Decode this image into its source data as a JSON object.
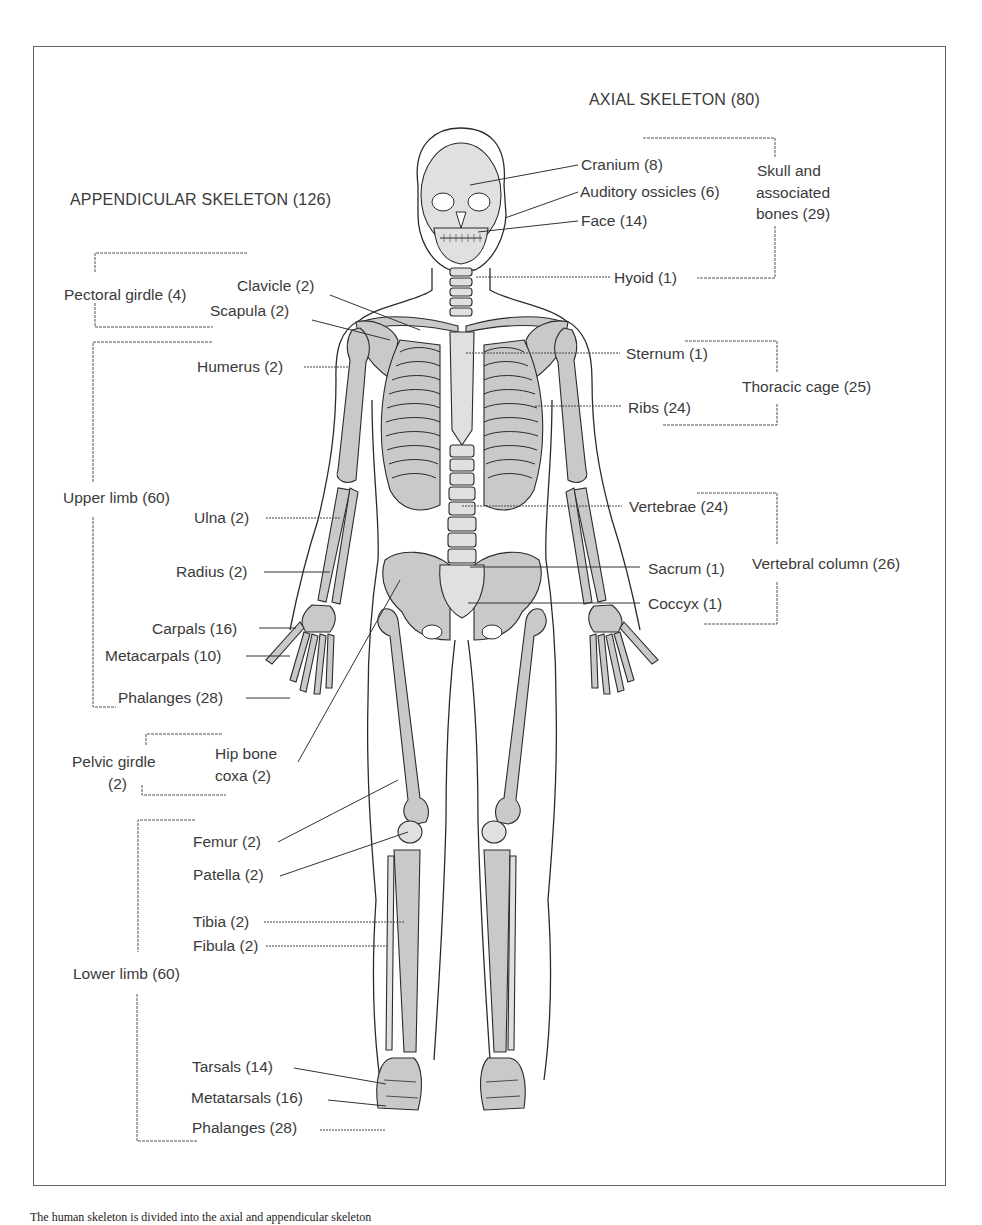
{
  "figure": {
    "sections": {
      "axial": "AXIAL SKELETON (80)",
      "appendicular": "APPENDICULAR SKELETON (126)"
    },
    "axial_groups": {
      "skull": {
        "line1": "Skull and",
        "line2": "associated",
        "line3": "bones (29)",
        "items": [
          "Cranium (8)",
          "Auditory ossicles (6)",
          "Face (14)",
          "Hyoid (1)"
        ]
      },
      "thoracic": {
        "label": "Thoracic cage (25)",
        "items": [
          "Sternum (1)",
          "Ribs (24)"
        ]
      },
      "vertebral": {
        "label": "Vertebral column (26)",
        "items": [
          "Vertebrae (24)",
          "Sacrum (1)",
          "Coccyx (1)"
        ]
      }
    },
    "appendicular_groups": {
      "pectoral": {
        "label": "Pectoral girdle (4)",
        "items": [
          "Clavicle (2)",
          "Scapula (2)"
        ]
      },
      "upper_limb": {
        "label": "Upper limb (60)",
        "items": [
          "Humerus (2)",
          "Ulna (2)",
          "Radius (2)",
          "Carpals (16)",
          "Metacarpals (10)",
          "Phalanges (28)"
        ]
      },
      "pelvic": {
        "line1": "Pelvic girdle",
        "line2": "(2)",
        "item_line1": "Hip bone",
        "item_line2": "coxa (2)"
      },
      "lower_limb": {
        "label": "Lower limb (60)",
        "items": [
          "Femur (2)",
          "Patella (2)",
          "Tibia (2)",
          "Fibula (2)",
          "Tarsals (14)",
          "Metatarsals (16)",
          "Phalanges (28)"
        ]
      }
    },
    "caption": "The human skeleton is divided into the axial and appendicular skeleton",
    "colors": {
      "bone_fill": "#c9c9c9",
      "bone_light": "#e2e2e2",
      "outline": "#2b2b2b",
      "text": "#3a3a3a"
    }
  }
}
